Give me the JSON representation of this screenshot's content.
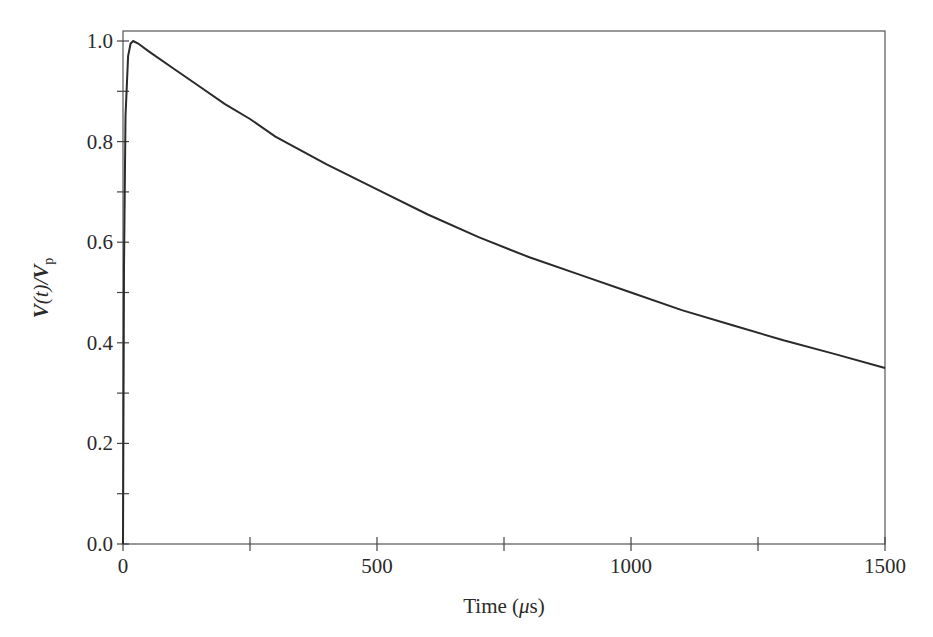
{
  "chart_data": {
    "type": "line",
    "title": "",
    "xlabel": "Time (μs)",
    "ylabel": "V(t)/Vp",
    "xlim": [
      0,
      1500
    ],
    "ylim": [
      0.0,
      1.0
    ],
    "grid": false,
    "legend": null,
    "x_ticks": [
      0,
      500,
      1000,
      1500
    ],
    "x_minor_ticks": [
      250,
      750,
      1250
    ],
    "y_ticks": [
      "0.0",
      "0.2",
      "0.4",
      "0.6",
      "0.8",
      "1.0"
    ],
    "y_tick_values": [
      0.0,
      0.2,
      0.4,
      0.6,
      0.8,
      1.0
    ],
    "y_minor_ticks": [
      0.1,
      0.3,
      0.5,
      0.7,
      0.9
    ],
    "series": [
      {
        "name": "V(t)/Vp",
        "x": [
          0,
          2,
          5,
          10,
          15,
          20,
          30,
          50,
          100,
          150,
          200,
          250,
          300,
          400,
          500,
          600,
          700,
          800,
          900,
          1000,
          1100,
          1200,
          1300,
          1400,
          1500
        ],
        "y": [
          0.0,
          0.55,
          0.85,
          0.97,
          0.995,
          1.0,
          0.995,
          0.98,
          0.945,
          0.91,
          0.875,
          0.845,
          0.81,
          0.755,
          0.705,
          0.655,
          0.61,
          0.57,
          0.535,
          0.5,
          0.465,
          0.435,
          0.405,
          0.378,
          0.35
        ]
      }
    ]
  },
  "axes": {
    "x_label_main": "Time (",
    "x_label_mu": "μ",
    "x_label_end": "s)",
    "y_label_V": "V",
    "y_label_t": "(t)/",
    "y_label_Vp": "V",
    "y_label_sub": "p"
  }
}
